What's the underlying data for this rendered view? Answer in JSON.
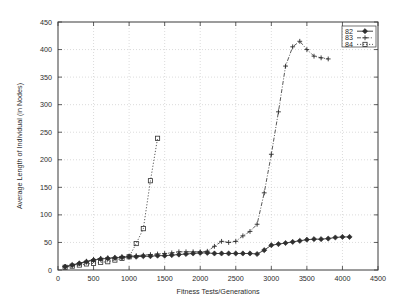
{
  "chart_data": {
    "type": "line",
    "title": "",
    "xlabel": "Fitness Tests/Generations",
    "ylabel": "Average Length of Individual (in Nodes)",
    "xlim": [
      0,
      4500
    ],
    "ylim": [
      0,
      450
    ],
    "xticks": [
      0,
      500,
      1000,
      1500,
      2000,
      2500,
      3000,
      3500,
      4000,
      4500
    ],
    "yticks": [
      0,
      50,
      100,
      150,
      200,
      250,
      300,
      350,
      400,
      450
    ],
    "grid": true,
    "legend_position": "top-right",
    "series": [
      {
        "name": "82",
        "marker": "filled-diamond",
        "linestyle": "solid",
        "x": [
          100,
          200,
          300,
          400,
          500,
          600,
          700,
          800,
          900,
          1000,
          1100,
          1200,
          1300,
          1400,
          1500,
          1600,
          1700,
          1800,
          1900,
          2000,
          2100,
          2200,
          2300,
          2400,
          2500,
          2600,
          2700,
          2800,
          2900,
          3000,
          3100,
          3200,
          3300,
          3400,
          3500,
          3600,
          3700,
          3800,
          3900,
          4000,
          4100
        ],
        "y": [
          6,
          9,
          12,
          15,
          18,
          20,
          21,
          22,
          23,
          24,
          24,
          25,
          25,
          26,
          26,
          27,
          28,
          29,
          30,
          31,
          31,
          30,
          30,
          30,
          30,
          30,
          30,
          29,
          36,
          45,
          47,
          49,
          51,
          53,
          55,
          56,
          56,
          57,
          59,
          60,
          60
        ]
      },
      {
        "name": "83",
        "marker": "plus",
        "linestyle": "dash-dot",
        "x": [
          100,
          200,
          300,
          400,
          500,
          600,
          700,
          800,
          900,
          1000,
          1100,
          1200,
          1300,
          1400,
          1500,
          1600,
          1700,
          1800,
          1900,
          2000,
          2100,
          2200,
          2300,
          2400,
          2500,
          2600,
          2700,
          2800,
          2900,
          3000,
          3100,
          3200,
          3300,
          3400,
          3500,
          3600,
          3700,
          3800
        ],
        "y": [
          6,
          9,
          12,
          16,
          19,
          21,
          22,
          23,
          24,
          25,
          26,
          27,
          28,
          29,
          30,
          31,
          33,
          33,
          33,
          33,
          34,
          43,
          52,
          50,
          52,
          62,
          70,
          83,
          140,
          210,
          287,
          370,
          405,
          415,
          400,
          388,
          385,
          383
        ]
      },
      {
        "name": "84",
        "marker": "open-square",
        "linestyle": "dotted",
        "x": [
          100,
          200,
          300,
          400,
          500,
          600,
          700,
          800,
          900,
          1000,
          1100,
          1200,
          1300,
          1400
        ],
        "y": [
          5,
          7,
          9,
          11,
          12,
          14,
          15,
          18,
          21,
          24,
          48,
          75,
          162,
          239
        ]
      }
    ]
  },
  "legend": {
    "entries": [
      {
        "label": "82"
      },
      {
        "label": "83"
      },
      {
        "label": "84"
      }
    ]
  },
  "colors": {
    "axis": "#3a3a3a",
    "grid": "#b9b9b9",
    "series": "#2f2f2f",
    "background": "#ffffff"
  }
}
